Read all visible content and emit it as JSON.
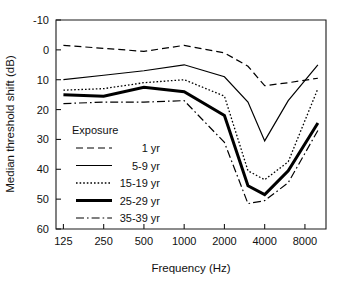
{
  "chart_data": {
    "type": "line",
    "title": "",
    "xlabel": "Frequency (Hz)",
    "ylabel": "Median threshold shift (dB)",
    "x_scale": "log",
    "x_tick_values": [
      125,
      250,
      500,
      1000,
      2000,
      4000,
      8000
    ],
    "x_tick_labels": [
      "125",
      "250",
      "500",
      "1000",
      "2000",
      "4000",
      "8000"
    ],
    "xlim": [
      110,
      11500
    ],
    "y_tick_values": [
      -10,
      0,
      10,
      20,
      30,
      40,
      50,
      60
    ],
    "y_tick_labels": [
      "-10",
      "0",
      "10",
      "20",
      "30",
      "40",
      "50",
      "60"
    ],
    "ylim": [
      -10,
      60
    ],
    "y_axis_inverted": true,
    "grid": false,
    "legend_position": "inside-lower-left",
    "legend_title": "Exposure",
    "x": [
      125,
      250,
      500,
      1000,
      2000,
      3000,
      4000,
      6000,
      10000
    ],
    "series": [
      {
        "name": "1 yr",
        "style": "dashed",
        "width": 1.2,
        "values": [
          -1.5,
          -0.5,
          0.5,
          -1.5,
          1.0,
          5.5,
          12.0,
          11.0,
          9.5
        ]
      },
      {
        "name": "5-9 yr",
        "style": "solid",
        "width": 1.2,
        "values": [
          10.0,
          8.5,
          7.0,
          5.0,
          9.0,
          17.5,
          30.5,
          17.0,
          5.0
        ]
      },
      {
        "name": "15-19 yr",
        "style": "dotted",
        "width": 1.3,
        "values": [
          13.5,
          13.0,
          11.0,
          10.0,
          15.5,
          40.5,
          43.5,
          37.5,
          13.0
        ]
      },
      {
        "name": "25-29 yr",
        "style": "solid",
        "width": 3.0,
        "values": [
          15.0,
          15.5,
          12.5,
          14.0,
          22.0,
          45.5,
          48.5,
          40.5,
          24.5
        ]
      },
      {
        "name": "35-39 yr",
        "style": "dashdot",
        "width": 1.2,
        "values": [
          18.0,
          17.5,
          17.5,
          17.0,
          31.0,
          51.5,
          50.5,
          44.5,
          27.0
        ]
      }
    ]
  },
  "axes": {
    "x_title": "Frequency (Hz)",
    "y_title": "Median threshold shift (dB)",
    "x_ticks": [
      "125",
      "250",
      "500",
      "1000",
      "2000",
      "4000",
      "8000"
    ],
    "y_ticks": [
      "-10",
      "0",
      "10",
      "20",
      "30",
      "40",
      "50",
      "60"
    ]
  },
  "legend": {
    "title": "Exposure",
    "entries": [
      {
        "label": "1 yr"
      },
      {
        "label": "5-9 yr"
      },
      {
        "label": "15-19 yr"
      },
      {
        "label": "25-29 yr"
      },
      {
        "label": "35-39 yr"
      }
    ]
  },
  "colors": {
    "line": "#000000",
    "axis": "#1a1a1a",
    "background": "#ffffff"
  }
}
